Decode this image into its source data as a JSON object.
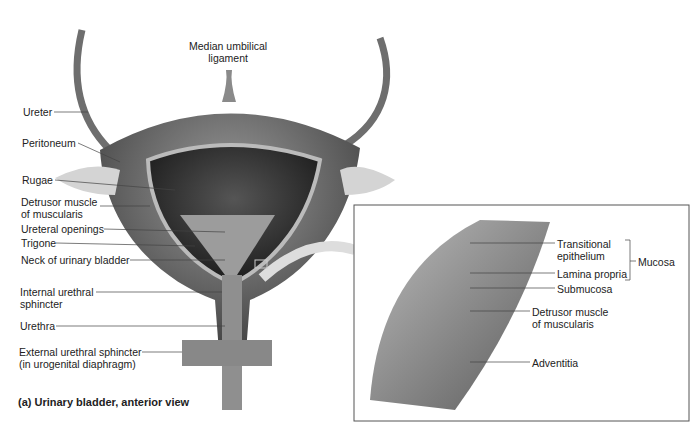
{
  "figure": {
    "caption": "(a) Urinary bladder, anterior view"
  },
  "bladder_labels": {
    "median_umbilical_1": "Median umbilical",
    "median_umbilical_2": "ligament",
    "ureter": "Ureter",
    "peritoneum": "Peritoneum",
    "rugae": "Rugae",
    "detrusor_1": "Detrusor muscle",
    "detrusor_2": "of muscularis",
    "ureteral_openings": "Ureteral openings",
    "trigone": "Trigone",
    "neck": "Neck of urinary bladder",
    "internal_sphincter_1": "Internal urethral",
    "internal_sphincter_2": "sphincter",
    "urethra": "Urethra",
    "external_sphincter_1": "External urethral sphincter",
    "external_sphincter_2": "(in urogenital diaphragm)"
  },
  "wall_labels": {
    "transitional_1": "Transitional",
    "transitional_2": "epithelium",
    "lamina_propria": "Lamina propria",
    "submucosa": "Submucosa",
    "detrusor_1": "Detrusor muscle",
    "detrusor_2": "of muscularis",
    "adventitia": "Adventitia",
    "mucosa": "Mucosa"
  }
}
